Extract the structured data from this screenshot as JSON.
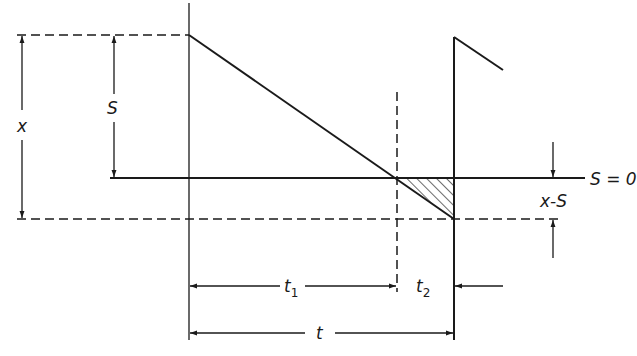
{
  "diagram": {
    "title": "",
    "labels": {
      "x": "x",
      "S": "S",
      "S_zero": "S = 0",
      "x_minus_S": "x-S",
      "t1_base": "t",
      "t1_sub": "1",
      "t2_base": "t",
      "t2_sub": "2",
      "t": "t"
    },
    "colors": {
      "line": "#1a1a1a",
      "background": "#ffffff"
    }
  }
}
